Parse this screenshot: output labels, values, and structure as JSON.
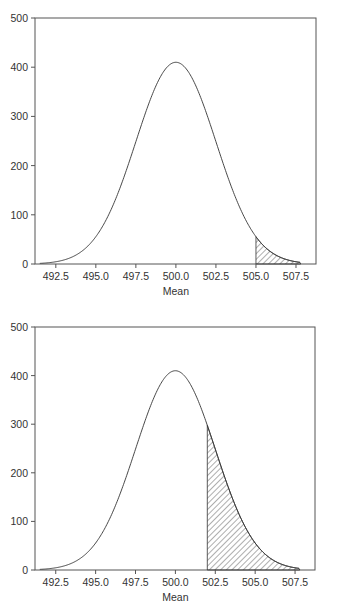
{
  "chart_data": [
    {
      "type": "area",
      "title": "",
      "xlabel": "Mean",
      "ylabel": "",
      "xlim": [
        491.2,
        508.75
      ],
      "ylim": [
        0,
        500
      ],
      "grid": false,
      "legend": null,
      "x_ticks": [
        "492.5",
        "495.0",
        "497.5",
        "500.0",
        "502.5",
        "505.0",
        "507.5"
      ],
      "y_ticks": [
        "0",
        "100",
        "200",
        "300",
        "400",
        "500"
      ],
      "curve": {
        "type": "normal",
        "mean": 500,
        "sd": 2.5,
        "peak": 410
      },
      "shaded_region": {
        "from": 505.0,
        "to": 507.8,
        "pattern": "diagonal-hatch"
      },
      "series": [
        {
          "name": "sampling distribution",
          "x": [
            491.5,
            492.5,
            495.0,
            497.5,
            500.0,
            502.5,
            505.0,
            507.5
          ],
          "values": [
            1,
            4,
            55,
            249,
            410,
            249,
            55,
            4
          ]
        }
      ]
    },
    {
      "type": "area",
      "title": "",
      "xlabel": "Mean",
      "ylabel": "",
      "xlim": [
        491.2,
        508.75
      ],
      "ylim": [
        0,
        500
      ],
      "grid": false,
      "legend": null,
      "x_ticks": [
        "492.5",
        "495.0",
        "497.5",
        "500.0",
        "502.5",
        "505.0",
        "507.5"
      ],
      "y_ticks": [
        "0",
        "100",
        "200",
        "300",
        "400",
        "500"
      ],
      "curve": {
        "type": "normal",
        "mean": 500,
        "sd": 2.5,
        "peak": 410
      },
      "shaded_region": {
        "from": 502.0,
        "to": 507.8,
        "pattern": "diagonal-hatch"
      },
      "series": [
        {
          "name": "sampling distribution",
          "x": [
            491.5,
            492.5,
            495.0,
            497.5,
            500.0,
            502.0,
            502.5,
            505.0,
            507.5
          ],
          "values": [
            1,
            4,
            55,
            249,
            410,
            297,
            249,
            55,
            4
          ]
        }
      ]
    }
  ]
}
